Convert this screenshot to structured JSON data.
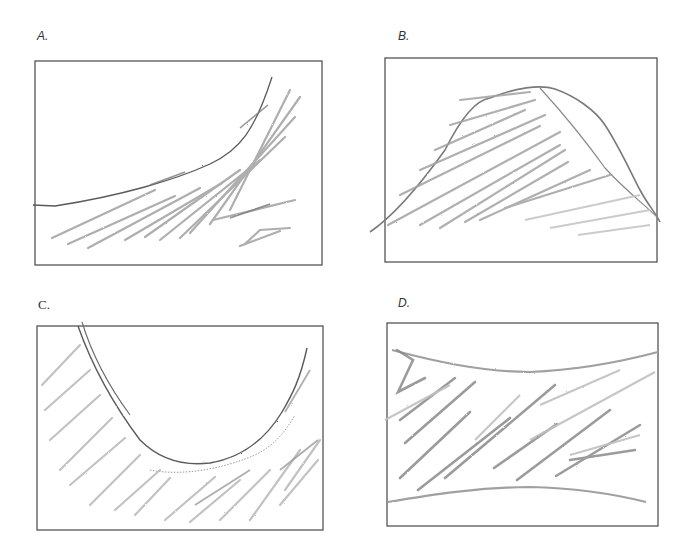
{
  "figure": {
    "panels": [
      {
        "id": "A",
        "label": "A.",
        "description": "Region below an increasing, concave-up curve rising to the upper right, shaded with diagonal pencil hatching"
      },
      {
        "id": "B",
        "label": "B.",
        "description": "Region below a hump/peak-shaped curve (rounded top, falling steeply to the right), shaded with diagonal pencil hatching"
      },
      {
        "id": "C",
        "label": "C.",
        "description": "Region below a U-shaped (concave-up) curve, outside the bowl, shaded with diagonal pencil hatching"
      },
      {
        "id": "D",
        "label": "D.",
        "description": "Region between a concave-up upper curve and a concave-down lower curve, shaded with diagonal pencil hatching"
      }
    ],
    "colors": {
      "frame": "#555555",
      "curve_dark": "#5a5a5a",
      "hatch": "#9a9a9a",
      "hatch_light": "#c4c4c4"
    }
  }
}
